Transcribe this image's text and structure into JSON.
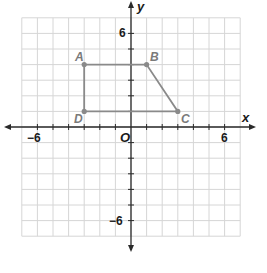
{
  "chart_data": {
    "type": "scatter",
    "title": "",
    "xlabel": "x",
    "ylabel": "y",
    "xlim": [
      -7,
      7
    ],
    "ylim": [
      -7,
      7
    ],
    "grid": true,
    "origin_label": "O",
    "tick_labels": {
      "x": [
        {
          "value": -6,
          "label": "−6"
        },
        {
          "value": 6,
          "label": "6"
        }
      ],
      "y": [
        {
          "value": 6,
          "label": "6"
        },
        {
          "value": -6,
          "label": "−6"
        }
      ]
    },
    "points": [
      {
        "name": "A",
        "x": -3,
        "y": 4
      },
      {
        "name": "B",
        "x": 1,
        "y": 4
      },
      {
        "name": "C",
        "x": 3,
        "y": 1
      },
      {
        "name": "D",
        "x": -3,
        "y": 1
      }
    ],
    "polygon": {
      "name": "ABCD",
      "vertices": [
        "A",
        "B",
        "C",
        "D"
      ]
    },
    "colors": {
      "grid": "#d6d6d6",
      "axis": "#2a2a2a",
      "shape": "#8a8a8a",
      "point_label": "#7a7a7a"
    }
  },
  "labels": {
    "x_axis": "x",
    "y_axis": "y",
    "origin": "O",
    "x_neg6": "−6",
    "x_pos6": "6",
    "y_pos6": "6",
    "y_neg6": "−6",
    "A": "A",
    "B": "B",
    "C": "C",
    "D": "D"
  }
}
